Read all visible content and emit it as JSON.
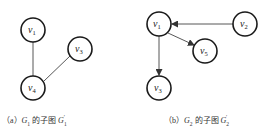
{
  "figures": [
    {
      "id": "a",
      "caption": {
        "prefix": "（a）",
        "graph": "G",
        "graph_sub": "1",
        "mid": " 的子图 ",
        "subgraph": "G",
        "subgraph_sub": "1",
        "subgraph_sup": "′"
      },
      "nodes": [
        {
          "name": "v",
          "sub": "1",
          "x": 33,
          "y": 30
        },
        {
          "name": "v",
          "sub": "3",
          "x": 80,
          "y": 49
        },
        {
          "name": "v",
          "sub": "4",
          "x": 33,
          "y": 88
        }
      ],
      "edges": [
        {
          "from": "v1",
          "to": "v4",
          "directed": false
        },
        {
          "from": "v3",
          "to": "v4",
          "directed": false
        }
      ]
    },
    {
      "id": "b",
      "caption": {
        "prefix": "（b）",
        "graph": "G",
        "graph_sub": "2",
        "mid": " 的子图 ",
        "subgraph": "G",
        "subgraph_sub": "2",
        "subgraph_sup": "′"
      },
      "nodes": [
        {
          "name": "v",
          "sub": "1",
          "x": 159,
          "y": 24
        },
        {
          "name": "v",
          "sub": "2",
          "x": 245,
          "y": 24
        },
        {
          "name": "v",
          "sub": "5",
          "x": 205,
          "y": 51
        },
        {
          "name": "v",
          "sub": "3",
          "x": 159,
          "y": 88
        }
      ],
      "edges": [
        {
          "from": "v2",
          "to": "v1",
          "directed": true
        },
        {
          "from": "v1",
          "to": "v5",
          "directed": true
        },
        {
          "from": "v1",
          "to": "v3",
          "directed": true
        }
      ]
    }
  ]
}
